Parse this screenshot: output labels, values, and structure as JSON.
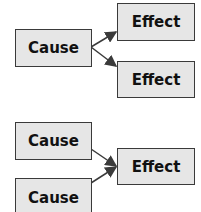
{
  "diagram": {
    "top_group": {
      "cause": {
        "label": "Cause"
      },
      "effects": [
        {
          "label": "Effect"
        },
        {
          "label": "Effect"
        }
      ]
    },
    "bottom_group": {
      "causes": [
        {
          "label": "Cause"
        },
        {
          "label": "Cause"
        }
      ],
      "effect": {
        "label": "Effect"
      }
    },
    "colors": {
      "box_fill": "#e6e6e6",
      "box_border": "#3a3a3a",
      "arrow": "#3a3a3a"
    }
  }
}
